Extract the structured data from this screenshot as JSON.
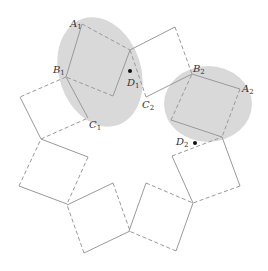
{
  "colors": {
    "background": "#ffffff",
    "ellipse_fill": "#d9d9d9",
    "stroke": "#9a9a9a",
    "point": "#111111",
    "label": "#333333"
  },
  "ellipses": [
    {
      "name": "left-highlight",
      "cx": 100,
      "cy": 72,
      "rx": 41,
      "ry": 56,
      "rotate": -18
    },
    {
      "name": "right-highlight",
      "cx": 208,
      "cy": 104,
      "rx": 44,
      "ry": 38,
      "rotate": 0
    }
  ],
  "squares": [
    {
      "name": "square-A1",
      "points": [
        [
          82,
          24
        ],
        [
          130,
          50
        ],
        [
          113,
          96
        ],
        [
          66,
          77
        ]
      ],
      "edge_styles": [
        "dashed",
        "solid",
        "dashed",
        "solid"
      ]
    },
    {
      "name": "square-top",
      "points": [
        [
          130,
          50
        ],
        [
          175,
          27
        ],
        [
          192,
          74
        ],
        [
          146,
          97
        ]
      ],
      "edge_styles": [
        "solid",
        "dashed",
        "solid",
        "dashed"
      ]
    },
    {
      "name": "square-A2",
      "points": [
        [
          192,
          74
        ],
        [
          240,
          89
        ],
        [
          222,
          137
        ],
        [
          171,
          120
        ]
      ],
      "edge_styles": [
        "solid",
        "dashed",
        "solid",
        "dashed"
      ]
    },
    {
      "name": "square-right-lower",
      "points": [
        [
          172,
          156
        ],
        [
          222,
          137
        ],
        [
          240,
          186
        ],
        [
          193,
          203
        ]
      ],
      "edge_styles": [
        "dashed",
        "solid",
        "dashed",
        "solid"
      ]
    },
    {
      "name": "square-bottom-right",
      "points": [
        [
          146,
          183
        ],
        [
          193,
          203
        ],
        [
          176,
          251
        ],
        [
          129,
          231
        ]
      ],
      "edge_styles": [
        "dashed",
        "solid",
        "dashed",
        "solid"
      ]
    },
    {
      "name": "square-bottom-middle",
      "points": [
        [
          67,
          205
        ],
        [
          113,
          183
        ],
        [
          130,
          231
        ],
        [
          84,
          253
        ]
      ],
      "edge_styles": [
        "solid",
        "dashed",
        "solid",
        "dashed"
      ]
    },
    {
      "name": "square-lower-left",
      "points": [
        [
          41,
          139
        ],
        [
          88,
          157
        ],
        [
          67,
          204
        ],
        [
          19,
          186
        ]
      ],
      "edge_styles": [
        "solid",
        "dashed",
        "solid",
        "dashed"
      ]
    },
    {
      "name": "square-B1-C1",
      "points": [
        [
          66,
          77
        ],
        [
          20,
          97
        ],
        [
          41,
          139
        ],
        [
          88,
          118
        ]
      ],
      "edge_styles": [
        "dashed",
        "solid",
        "dashed",
        "solid"
      ]
    }
  ],
  "points": [
    {
      "name": "D1",
      "x": 130,
      "y": 71
    },
    {
      "name": "D2",
      "x": 195,
      "y": 143
    }
  ],
  "labels": [
    {
      "id": "A1",
      "base": "A",
      "sub": "1",
      "x": 70,
      "y": 27
    },
    {
      "id": "B1",
      "base": "B",
      "sub": "1",
      "x": 53,
      "y": 73
    },
    {
      "id": "C1",
      "base": "C",
      "sub": "1",
      "x": 89,
      "y": 128
    },
    {
      "id": "D1",
      "base": "D",
      "sub": "1",
      "x": 127,
      "y": 86
    },
    {
      "id": "B2",
      "base": "B",
      "sub": "2",
      "x": 193,
      "y": 72
    },
    {
      "id": "A2",
      "base": "A",
      "sub": "2",
      "x": 242,
      "y": 92
    },
    {
      "id": "C2",
      "base": "C",
      "sub": "2",
      "x": 142,
      "y": 108
    },
    {
      "id": "D2",
      "base": "D",
      "sub": "2",
      "x": 176,
      "y": 145
    }
  ]
}
